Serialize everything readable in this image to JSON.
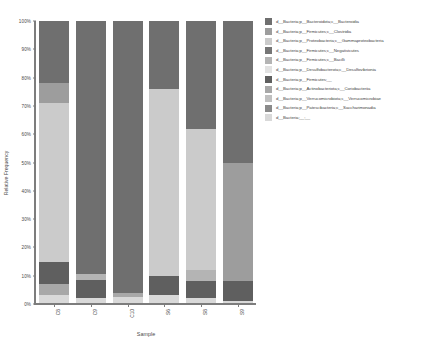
{
  "chart_data": {
    "type": "bar",
    "title": "",
    "subtitle": "",
    "xlabel": "Sample",
    "ylabel": "Relative Frequency",
    "ylim": [
      0,
      100
    ],
    "grid": false,
    "stacked": true,
    "normalized_percent": true,
    "legend_position": "right",
    "categories": [
      "C8",
      "C9",
      "C10",
      "S6",
      "S8",
      "S9"
    ],
    "ytick_labels": [
      "100%",
      "90%",
      "80%",
      "70%",
      "60%",
      "50%",
      "40%",
      "30%",
      "20%",
      "10%",
      "0%"
    ],
    "ytick_values": [
      100,
      90,
      80,
      70,
      60,
      50,
      40,
      30,
      20,
      10,
      0
    ],
    "series": [
      {
        "name": "d__Bacteria;p__Bacteroidota;c__Bacteroidia",
        "color": "#6f6f6f",
        "values": [
          22.0,
          89.5,
          96.0,
          24.0,
          38.0,
          50.0
        ]
      },
      {
        "name": "d__Bacteria;p__Firmicutes;c__Clostridia",
        "color": "#9d9d9d",
        "values": [
          7.0,
          0.0,
          0.0,
          0.0,
          0.0,
          42.0
        ]
      },
      {
        "name": "d__Bacteria;p__Proteobacteria;c__Gammaproteobacteria",
        "color": "#cbcbcb",
        "values": [
          56.0,
          0.0,
          0.0,
          66.0,
          50.0,
          0.0
        ]
      },
      {
        "name": "d__Bacteria;p__Firmicutes;c__Negativicutes",
        "color": "#767676",
        "values": [
          0.0,
          0.0,
          0.0,
          0.0,
          0.0,
          0.0
        ]
      },
      {
        "name": "d__Bacteria;p__Firmicutes;c__Bacilli",
        "color": "#b4b4b4",
        "values": [
          0.0,
          2.0,
          0.0,
          0.0,
          4.0,
          0.0
        ]
      },
      {
        "name": "d__Bacteria;p__Desulfobacterota;c__Desulfovibrionia",
        "color": "#e2e2e2",
        "values": [
          0.0,
          0.0,
          0.0,
          0.0,
          0.0,
          0.0
        ]
      },
      {
        "name": "d__Bacteria;p__Firmicutes;__",
        "color": "#5f5f5f",
        "values": [
          8.0,
          6.5,
          0.0,
          7.0,
          6.0,
          7.0
        ]
      },
      {
        "name": "d__Bacteria;p__Actinobacteriota;c__Coriobacteriia",
        "color": "#a8a8a8",
        "values": [
          4.0,
          0.0,
          1.5,
          0.0,
          0.0,
          0.0
        ]
      },
      {
        "name": "d__Bacteria;p__Verrucomicrobiota;c__Verrucomicrobiae",
        "color": "#c0c0c0",
        "values": [
          0.0,
          0.0,
          0.0,
          0.0,
          0.0,
          0.0
        ]
      },
      {
        "name": "d__Bacteria;p__Patescibacteria;c__Saccharimonadia",
        "color": "#8a8a8a",
        "values": [
          0.0,
          0.0,
          0.0,
          0.0,
          0.0,
          0.0
        ]
      },
      {
        "name": "d__Bacteria;__;__",
        "color": "#d9d9d9",
        "values": [
          3.0,
          2.0,
          2.5,
          3.0,
          2.0,
          1.0
        ]
      }
    ]
  }
}
